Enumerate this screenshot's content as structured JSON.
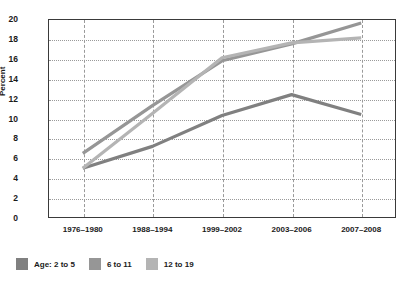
{
  "chart_data": {
    "type": "line",
    "title": "",
    "xlabel": "",
    "ylabel": "Percent",
    "ylim": [
      0,
      20
    ],
    "ytick_step": 2,
    "grid": true,
    "legend_position": "bottom-left",
    "categories": [
      "1976–1980",
      "1988–1994",
      "1999–2002",
      "2003–2006",
      "2007–2008"
    ],
    "yticks": [
      "0",
      "2",
      "4",
      "6",
      "8",
      "10",
      "12",
      "14",
      "16",
      "18",
      "20"
    ],
    "series": [
      {
        "name": "Age: 2 to 5",
        "color": "#808080",
        "values": [
          5.0,
          7.2,
          10.3,
          12.4,
          10.4
        ]
      },
      {
        "name": "6 to 11",
        "color": "#969696",
        "values": [
          6.5,
          11.3,
          15.8,
          17.5,
          19.6
        ]
      },
      {
        "name": "12 to 19",
        "color": "#b4b4b4",
        "values": [
          5.0,
          10.5,
          16.1,
          17.6,
          18.1
        ]
      }
    ]
  },
  "legend": {
    "entries": [
      {
        "label": "Age: 2 to 5",
        "color": "#808080"
      },
      {
        "label": "6 to 11",
        "color": "#969696"
      },
      {
        "label": "12 to 19",
        "color": "#b4b4b4"
      }
    ]
  },
  "axis": {
    "y_title": "Percent"
  }
}
